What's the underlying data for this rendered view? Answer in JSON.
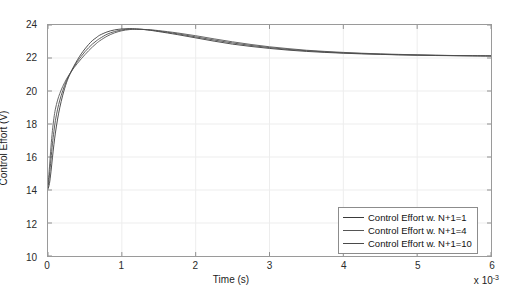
{
  "chart_data": {
    "type": "line",
    "title": "",
    "xlabel": "Time (s)",
    "ylabel": "Control Effort (V)",
    "x_multiplier": "x 10",
    "x_multiplier_exp": "-3",
    "xlim": [
      0,
      6
    ],
    "ylim": [
      10,
      24
    ],
    "xticks": [
      0,
      1,
      2,
      3,
      4,
      5,
      6
    ],
    "xticklabels": [
      "0",
      "1",
      "2",
      "3",
      "4",
      "5",
      "6"
    ],
    "yticks": [
      10,
      12,
      14,
      16,
      18,
      20,
      22,
      24
    ],
    "yticklabels": [
      "10",
      "12",
      "14",
      "16",
      "18",
      "20",
      "22",
      "24"
    ],
    "grid": true,
    "legend_position": "lower right",
    "series": [
      {
        "name": "Control Effort w. N+1=1",
        "color": "#3a3a3a",
        "x": [
          0,
          0.02,
          0.04,
          0.06,
          0.08,
          0.1,
          0.13,
          0.16,
          0.2,
          0.25,
          0.3,
          0.35,
          0.4,
          0.45,
          0.5,
          0.55,
          0.6,
          0.65,
          0.7,
          0.8,
          0.9,
          1.0,
          1.1,
          1.2,
          1.35,
          1.5,
          1.75,
          2.0,
          2.25,
          2.5,
          2.75,
          3.0,
          3.25,
          3.5,
          3.75,
          4.0,
          4.25,
          4.5,
          4.75,
          5.0,
          5.25,
          5.5,
          5.75,
          6.0
        ],
        "y": [
          14.05,
          14.4,
          15.1,
          15.95,
          16.75,
          17.45,
          18.3,
          19.0,
          19.75,
          20.5,
          21.05,
          21.5,
          21.9,
          22.25,
          22.55,
          22.82,
          23.05,
          23.22,
          23.38,
          23.58,
          23.7,
          23.76,
          23.78,
          23.76,
          23.7,
          23.6,
          23.42,
          23.22,
          23.02,
          22.84,
          22.7,
          22.58,
          22.48,
          22.4,
          22.34,
          22.29,
          22.25,
          22.22,
          22.19,
          22.17,
          22.15,
          22.14,
          22.13,
          22.12
        ]
      },
      {
        "name": "Control Effort w. N+1=4",
        "color": "#555555",
        "x": [
          0,
          0.02,
          0.04,
          0.06,
          0.08,
          0.1,
          0.13,
          0.16,
          0.2,
          0.25,
          0.3,
          0.35,
          0.4,
          0.45,
          0.5,
          0.55,
          0.6,
          0.65,
          0.7,
          0.8,
          0.9,
          1.0,
          1.1,
          1.2,
          1.35,
          1.5,
          1.75,
          2.0,
          2.25,
          2.5,
          2.75,
          3.0,
          3.25,
          3.5,
          3.75,
          4.0,
          4.25,
          4.5,
          4.75,
          5.0,
          5.25,
          5.5,
          5.75,
          6.0
        ],
        "y": [
          14.3,
          15.4,
          16.6,
          17.6,
          18.35,
          18.9,
          19.45,
          19.85,
          20.28,
          20.72,
          21.08,
          21.4,
          21.68,
          21.95,
          22.2,
          22.44,
          22.66,
          22.86,
          23.04,
          23.32,
          23.52,
          23.65,
          23.72,
          23.74,
          23.72,
          23.66,
          23.52,
          23.35,
          23.16,
          22.98,
          22.82,
          22.68,
          22.57,
          22.47,
          22.4,
          22.34,
          22.29,
          22.25,
          22.22,
          22.19,
          22.17,
          22.15,
          22.14,
          22.13
        ]
      },
      {
        "name": "Control Effort w. N+1=10",
        "color": "#4a4a4a",
        "x": [
          0,
          0.02,
          0.04,
          0.06,
          0.08,
          0.1,
          0.13,
          0.16,
          0.2,
          0.25,
          0.3,
          0.35,
          0.4,
          0.45,
          0.5,
          0.55,
          0.6,
          0.65,
          0.7,
          0.8,
          0.9,
          1.0,
          1.1,
          1.2,
          1.35,
          1.5,
          1.75,
          2.0,
          2.25,
          2.5,
          2.75,
          3.0,
          3.25,
          3.5,
          3.75,
          4.0,
          4.25,
          4.5,
          4.75,
          5.0,
          5.25,
          5.5,
          5.75,
          6.0
        ],
        "y": [
          14.15,
          14.9,
          15.85,
          16.8,
          17.55,
          18.2,
          18.9,
          19.45,
          20.02,
          20.62,
          21.06,
          21.45,
          21.8,
          22.1,
          22.38,
          22.62,
          22.84,
          23.02,
          23.18,
          23.44,
          23.6,
          23.7,
          23.75,
          23.75,
          23.71,
          23.63,
          23.47,
          23.28,
          23.09,
          22.91,
          22.76,
          22.63,
          22.52,
          22.44,
          22.37,
          22.31,
          22.27,
          22.23,
          22.2,
          22.18,
          22.16,
          22.145,
          22.135,
          22.125
        ]
      }
    ]
  },
  "legend": {
    "entries": [
      "Control Effort w. N+1=1",
      "Control Effort w. N+1=4",
      "Control Effort w. N+1=10"
    ]
  }
}
